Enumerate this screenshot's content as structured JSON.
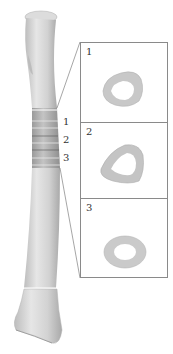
{
  "figure": {
    "band_labels": [
      "1",
      "2",
      "3"
    ],
    "sections": [
      {
        "number": "1",
        "shape": "rounded-quadrilateral"
      },
      {
        "number": "2",
        "shape": "triangular"
      },
      {
        "number": "3",
        "shape": "oval"
      }
    ],
    "colors": {
      "bone": "#d9d9d9",
      "bone_shadow": "#a8a8a8",
      "band_highlight": "#ffffff",
      "section_fill": "#c8c8c8",
      "box_border": "#8a8a8a"
    }
  }
}
